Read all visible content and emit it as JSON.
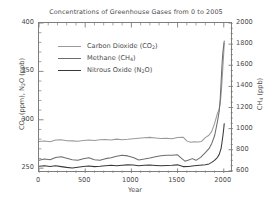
{
  "chart_data": {
    "type": "line",
    "title": "Concentrations of Greenhouse Gases from 0 to 2005",
    "xlabel": "Year",
    "ylabel_left": "CO2 (ppm), N2O (ppb)",
    "ylabel_right": "CH4 (ppb)",
    "xlim": [
      0,
      2100
    ],
    "ylim_left": [
      245,
      400
    ],
    "ylim_right": [
      580,
      2000
    ],
    "xticks": [
      0,
      500,
      1000,
      1500,
      2000
    ],
    "yticks_left": [
      250,
      300,
      350,
      400
    ],
    "yticks_right": [
      600,
      800,
      1000,
      1200,
      1400,
      1600,
      1800,
      2000
    ],
    "grid": false,
    "legend_position": "upper-left-inside",
    "series": [
      {
        "name": "Carbon Dioxide (CO2)",
        "legend_label_html": "Carbon Dioxide (CO<sub>2</sub>)",
        "axis": "left",
        "unit": "ppm",
        "color": "#9a9a9a",
        "x": [
          0,
          60,
          120,
          180,
          240,
          300,
          360,
          420,
          480,
          540,
          600,
          660,
          720,
          780,
          840,
          900,
          960,
          1020,
          1080,
          1140,
          1200,
          1260,
          1320,
          1380,
          1440,
          1500,
          1560,
          1600,
          1640,
          1680,
          1720,
          1760,
          1800,
          1840,
          1870,
          1900,
          1930,
          1950,
          1960,
          1970,
          1980,
          1990,
          2000,
          2005
        ],
        "y": [
          277.5,
          278.0,
          277.4,
          279.0,
          279.3,
          278.4,
          278.2,
          277.8,
          278.6,
          279.0,
          278.6,
          279.4,
          279.6,
          279.2,
          280.0,
          279.4,
          279.8,
          280.4,
          281.0,
          281.4,
          281.8,
          281.2,
          280.6,
          281.0,
          280.4,
          281.6,
          282.0,
          278.2,
          276.8,
          277.4,
          277.0,
          277.6,
          281.5,
          284.0,
          288.0,
          296.0,
          306.0,
          311.0,
          316.0,
          325.0,
          338.0,
          354.0,
          369.0,
          379.0
        ]
      },
      {
        "name": "Methane (CH4)",
        "legend_label_html": "Methane (CH<sub>4</sub>)",
        "axis": "right",
        "unit": "ppb",
        "color": "#6d6d6d",
        "x": [
          0,
          60,
          120,
          180,
          240,
          300,
          360,
          420,
          480,
          540,
          600,
          660,
          720,
          780,
          840,
          900,
          960,
          1020,
          1080,
          1140,
          1200,
          1260,
          1320,
          1380,
          1440,
          1500,
          1540,
          1580,
          1620,
          1660,
          1700,
          1750,
          1800,
          1840,
          1870,
          1900,
          1930,
          1950,
          1960,
          1970,
          1980,
          1990,
          2000,
          2005
        ],
        "y": [
          700.0,
          712.0,
          705.0,
          726.0,
          733.0,
          720.0,
          706.0,
          700.0,
          714.0,
          724.0,
          706.0,
          700.0,
          716.0,
          724.0,
          738.0,
          748.0,
          742.0,
          726.0,
          704.0,
          712.0,
          722.0,
          734.0,
          744.0,
          748.0,
          748.0,
          752.0,
          720.0,
          692.0,
          702.0,
          716.0,
          700.0,
          728.0,
          772.0,
          810.0,
          860.0,
          930.0,
          1060.0,
          1160.0,
          1260.0,
          1420.0,
          1590.0,
          1720.0,
          1790.0,
          1830.0
        ]
      },
      {
        "name": "Nitrous Oxide (N2O)",
        "legend_label_html": "Nitrous Oxide (N<sub>2</sub>O)",
        "axis": "left",
        "unit": "ppb",
        "color": "#383838",
        "x": [
          0,
          60,
          120,
          180,
          240,
          300,
          360,
          420,
          480,
          540,
          600,
          660,
          720,
          780,
          840,
          900,
          960,
          1020,
          1080,
          1140,
          1200,
          1260,
          1320,
          1380,
          1440,
          1500,
          1560,
          1620,
          1680,
          1740,
          1800,
          1840,
          1870,
          1900,
          1930,
          1950,
          1960,
          1970,
          1980,
          1990,
          2000,
          2005
        ],
        "y": [
          252.0,
          252.6,
          251.8,
          252.4,
          251.6,
          250.8,
          250.2,
          251.0,
          251.8,
          252.2,
          251.6,
          252.0,
          252.6,
          253.0,
          252.4,
          253.0,
          253.4,
          253.2,
          252.6,
          253.0,
          253.2,
          252.8,
          252.4,
          252.8,
          253.0,
          253.4,
          251.6,
          251.8,
          252.4,
          253.0,
          253.6,
          254.4,
          256.0,
          258.0,
          261.0,
          264.0,
          267.0,
          270.0,
          276.0,
          283.0,
          291.0,
          296.0
        ]
      }
    ]
  }
}
